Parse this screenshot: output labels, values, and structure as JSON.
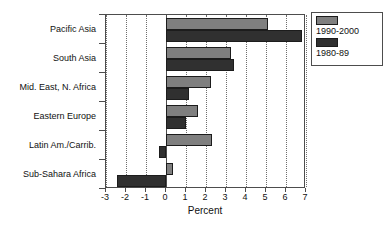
{
  "chart_data": {
    "type": "bar",
    "orientation": "horizontal",
    "title": "",
    "xlabel": "Percent",
    "ylabel": "",
    "xlim": [
      -3,
      7
    ],
    "xticks": [
      -3,
      -2,
      -1,
      0,
      1,
      2,
      3,
      4,
      5,
      6,
      7
    ],
    "xtick_labels": [
      "-3",
      "-2",
      "-1",
      "0",
      "1",
      "2",
      "3",
      "4",
      "5",
      "6",
      "7"
    ],
    "grid": "vertical-dotted",
    "legend_position": "top-right",
    "categories": [
      "Pacific Asia",
      "South Asia",
      "Mid. East, N. Africa",
      "Eastern Europe",
      "Latin Am./Carrib.",
      "Sub-Sahara Africa"
    ],
    "series": [
      {
        "name": "1990-2000",
        "color": "#7f7f7f",
        "values": [
          5.1,
          3.25,
          2.25,
          1.6,
          2.3,
          0.35
        ]
      },
      {
        "name": "1980-89",
        "color": "#303030",
        "values": [
          6.8,
          3.4,
          1.15,
          1.0,
          -0.35,
          -2.45
        ]
      }
    ]
  },
  "legend": {
    "entries": [
      {
        "label": "1990-2000",
        "swatch": "#7f7f7f"
      },
      {
        "label": "1980-89",
        "swatch": "#303030"
      }
    ]
  }
}
